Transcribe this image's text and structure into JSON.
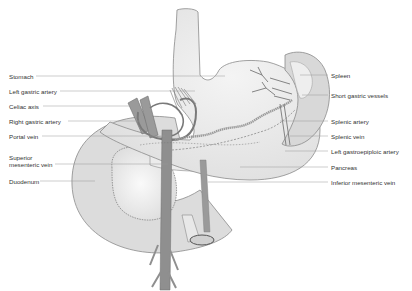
{
  "diagram": {
    "colors": {
      "organ_fill": "#e6e6e6",
      "organ_light": "#f3f3f3",
      "organ_outline": "#8a8a8a",
      "vessel": "#8f8f8f",
      "vessel_dark": "#6e6e6e",
      "leader_line": "#9a9a9a",
      "label_text": "#333333"
    },
    "labels_left": [
      {
        "id": "stomach",
        "text": "Stomach",
        "y": 73
      },
      {
        "id": "left-gastric-artery",
        "text": "Left gastric artery",
        "y": 88
      },
      {
        "id": "celiac-axis",
        "text": "Celiac axis",
        "y": 103
      },
      {
        "id": "right-gastric-artery",
        "text": "Right gastric artery",
        "y": 118
      },
      {
        "id": "portal-vein",
        "text": "Portal vein",
        "y": 133
      },
      {
        "id": "superior-mesenteric-vein-1",
        "text": "Superior",
        "y": 154
      },
      {
        "id": "superior-mesenteric-vein-2",
        "text": "mesenteric vein",
        "y": 161
      },
      {
        "id": "duodenum",
        "text": "Duodenum",
        "y": 178
      }
    ],
    "labels_right": [
      {
        "id": "spleen",
        "text": "Spleen",
        "y": 72
      },
      {
        "id": "short-gastric-vessels",
        "text": "Short gastric vessels",
        "y": 92
      },
      {
        "id": "splenic-artery",
        "text": "Splenic artery",
        "y": 118
      },
      {
        "id": "splenic-vein",
        "text": "Splenic vein",
        "y": 133
      },
      {
        "id": "left-gastroepiploic-artery",
        "text": "Left gastroepiploic artery",
        "y": 148
      },
      {
        "id": "pancreas",
        "text": "Pancreas",
        "y": 164
      },
      {
        "id": "inferior-mesenteric-vein",
        "text": "Inferior mesenteric vein",
        "y": 179
      }
    ]
  }
}
